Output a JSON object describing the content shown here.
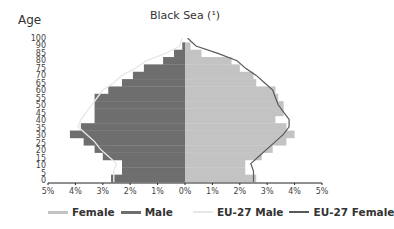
{
  "chart_data": {
    "type": "bar",
    "orientation": "horizontal-population-pyramid",
    "title": "Black Sea (¹)",
    "ylabel": "Age",
    "xlabel": "",
    "x_tick_labels": [
      "5%",
      "4%",
      "3%",
      "2%",
      "1%",
      "0%",
      "1%",
      "2%",
      "3%",
      "4%",
      "5%"
    ],
    "y_tick_labels": [
      "100",
      "90",
      "85",
      "80",
      "75",
      "70",
      "65",
      "60",
      "55",
      "50",
      "45",
      "40",
      "35",
      "30",
      "25",
      "20",
      "15",
      "10",
      "5",
      "0"
    ],
    "xlim": [
      -5,
      5
    ],
    "grid": false,
    "legend_position": "bottom",
    "categories": [
      "0",
      "5",
      "10",
      "15",
      "20",
      "25",
      "30",
      "35",
      "40",
      "45",
      "50",
      "55",
      "60",
      "65",
      "70",
      "75",
      "80",
      "85",
      "90"
    ],
    "series": [
      {
        "name": "Female",
        "side": "right",
        "color": "#c3c3c3",
        "values": [
          2.6,
          2.2,
          2.2,
          2.8,
          3.2,
          3.7,
          4.0,
          3.7,
          3.3,
          3.6,
          3.6,
          3.4,
          3.3,
          2.6,
          2.5,
          2.0,
          1.7,
          0.6,
          0.2
        ]
      },
      {
        "name": "Male",
        "side": "left",
        "color": "#6e6e6e",
        "values": [
          2.7,
          2.3,
          2.3,
          3.0,
          3.3,
          3.7,
          4.2,
          3.8,
          3.3,
          3.3,
          3.3,
          3.3,
          2.8,
          2.3,
          1.9,
          1.5,
          0.8,
          0.4,
          0.1
        ]
      },
      {
        "name": "EU-27 Male",
        "side": "left",
        "type": "line",
        "color": "#e8e8e8",
        "values": [
          2.6,
          2.6,
          2.5,
          2.8,
          3.1,
          3.3,
          3.6,
          3.9,
          3.8,
          3.6,
          3.4,
          3.2,
          3.0,
          2.6,
          2.3,
          1.8,
          1.4,
          0.7,
          0.2
        ]
      },
      {
        "name": "EU-27 Female",
        "side": "right",
        "type": "line",
        "color": "#5a5a5a",
        "values": [
          2.5,
          2.5,
          2.4,
          2.7,
          3.0,
          3.3,
          3.6,
          3.8,
          3.8,
          3.6,
          3.4,
          3.3,
          3.2,
          2.9,
          2.6,
          2.2,
          1.9,
          1.2,
          0.4
        ]
      }
    ]
  },
  "legend": {
    "items": [
      {
        "label": "Female",
        "color": "#c3c3c3"
      },
      {
        "label": "Male",
        "color": "#6e6e6e"
      },
      {
        "label": "EU-27 Male",
        "color": "#e8e8e8"
      },
      {
        "label": "EU-27 Female",
        "color": "#5a5a5a"
      }
    ]
  }
}
